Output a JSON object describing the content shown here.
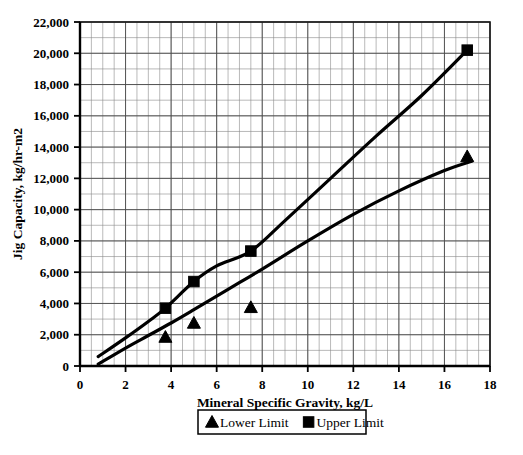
{
  "chart_data": {
    "type": "line",
    "title": "",
    "xlabel": "Mineral Specific Gravity, kg/L",
    "ylabel": "Jig Capacity, kg/hr-m2",
    "xlim": [
      0,
      18
    ],
    "ylim": [
      0,
      22000
    ],
    "xticks": [
      0,
      2,
      4,
      6,
      8,
      10,
      12,
      14,
      16,
      18
    ],
    "xtick_labels": [
      "0",
      "2",
      "4",
      "6",
      "8",
      "10",
      "12",
      "14",
      "16",
      "18"
    ],
    "yticks": [
      0,
      2000,
      4000,
      6000,
      8000,
      10000,
      12000,
      14000,
      16000,
      18000,
      20000,
      22000
    ],
    "ytick_labels": [
      "0",
      "2,000",
      "4,000",
      "6,000",
      "8,000",
      "10,000",
      "12,000",
      "14,000",
      "16,000",
      "18,000",
      "20,000",
      "22,000"
    ],
    "x_minor_step": 0.5,
    "y_minor_step": 1000,
    "grid": true,
    "grid_color": "#555555",
    "legend_position": "below",
    "series": [
      {
        "name": "Lower Limit",
        "marker": "triangle",
        "color": "#000000",
        "line": [
          [
            0.8,
            120
          ],
          [
            2.0,
            1150
          ],
          [
            3.0,
            1950
          ],
          [
            4.0,
            2750
          ],
          [
            5.0,
            3600
          ],
          [
            6.5,
            4900
          ],
          [
            8.0,
            6200
          ],
          [
            10.0,
            8000
          ],
          [
            12.0,
            9700
          ],
          [
            14.0,
            11200
          ],
          [
            16.0,
            12500
          ],
          [
            17.2,
            13100
          ]
        ],
        "points": [
          [
            3.75,
            1850
          ],
          [
            5.0,
            2750
          ],
          [
            7.5,
            3750
          ],
          [
            17.0,
            13400
          ]
        ]
      },
      {
        "name": "Upper Limit",
        "marker": "square",
        "color": "#000000",
        "line": [
          [
            0.8,
            600
          ],
          [
            2.0,
            1800
          ],
          [
            3.0,
            2850
          ],
          [
            3.75,
            3700
          ],
          [
            5.0,
            5400
          ],
          [
            6.0,
            6400
          ],
          [
            7.5,
            7350
          ],
          [
            9.0,
            9300
          ],
          [
            11.0,
            12000
          ],
          [
            13.0,
            14700
          ],
          [
            15.0,
            17300
          ],
          [
            17.0,
            20200
          ]
        ],
        "points": [
          [
            3.75,
            3700
          ],
          [
            5.0,
            5400
          ],
          [
            7.5,
            7350
          ],
          [
            17.0,
            20200
          ]
        ]
      }
    ],
    "legend": [
      {
        "label": "Lower Limit",
        "marker": "triangle"
      },
      {
        "label": "Upper Limit",
        "marker": "square"
      }
    ]
  },
  "caption": {
    "fragment": ""
  }
}
